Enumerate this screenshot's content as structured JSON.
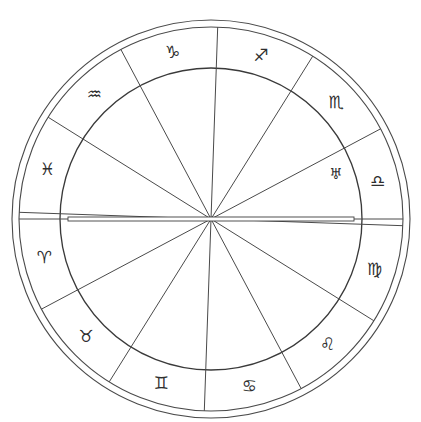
{
  "chart": {
    "type": "zodiac-wheel",
    "geometry": {
      "center_x": 211,
      "center_y": 219,
      "outer_radius": 199,
      "rim_radius": 192,
      "inner_radius": 151,
      "glyph_radius": 171,
      "ring_count": 3,
      "sector_count": 12,
      "sector_span_degrees": 30,
      "wheel_rotation_degrees": 2
    },
    "colors": {
      "background": "#ffffff",
      "line": "#4a4a4a",
      "inner_line": "#3a3a3a",
      "glyph": "#2e2e2e"
    },
    "axis": {
      "name": "ascendant-descendant-axis",
      "label": "Ascendant / Descendant horizontal axis",
      "orientation": "horizontal",
      "bar_half_length": 143,
      "bar_thickness": 4
    },
    "signs": [
      {
        "id": "sagittarius",
        "name": "Sagittarius",
        "glyph": "♐",
        "angle": -75,
        "sector_index": 0
      },
      {
        "id": "scorpio",
        "name": "Scorpio",
        "glyph": "♏",
        "angle": -45,
        "sector_index": 1
      },
      {
        "id": "libra",
        "name": "Libra",
        "glyph": "♎",
        "angle": -15,
        "sector_index": 2
      },
      {
        "id": "virgo",
        "name": "Virgo",
        "glyph": "♍",
        "angle": 15,
        "sector_index": 3
      },
      {
        "id": "leo",
        "name": "Leo",
        "glyph": "♌",
        "angle": 45,
        "sector_index": 4
      },
      {
        "id": "cancer",
        "name": "Cancer",
        "glyph": "♋",
        "angle": 75,
        "sector_index": 5
      },
      {
        "id": "gemini",
        "name": "Gemini",
        "glyph": "♊",
        "angle": 105,
        "sector_index": 6
      },
      {
        "id": "taurus",
        "name": "Taurus",
        "glyph": "♉",
        "angle": 135,
        "sector_index": 7
      },
      {
        "id": "aries",
        "name": "Aries",
        "glyph": "♈",
        "angle": 165,
        "sector_index": 8
      },
      {
        "id": "pisces",
        "name": "Pisces",
        "glyph": "♓",
        "angle": 195,
        "sector_index": 9
      },
      {
        "id": "aquarius",
        "name": "Aquarius",
        "glyph": "♒",
        "angle": 225,
        "sector_index": 10
      },
      {
        "id": "capricorn",
        "name": "Capricorn",
        "glyph": "♑",
        "angle": 255,
        "sector_index": 11
      }
    ],
    "planets": [
      {
        "id": "uranus",
        "name": "Uranus",
        "glyph": "♅",
        "angle": -22,
        "radius": 133
      }
    ]
  }
}
